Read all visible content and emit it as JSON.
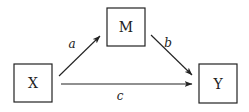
{
  "diagram": {
    "type": "mediation-path-diagram",
    "nodes": [
      {
        "id": "X",
        "label": "X"
      },
      {
        "id": "M",
        "label": "M"
      },
      {
        "id": "Y",
        "label": "Y"
      }
    ],
    "edges": [
      {
        "from": "X",
        "to": "M",
        "label": "a"
      },
      {
        "from": "M",
        "to": "Y",
        "label": "b"
      },
      {
        "from": "X",
        "to": "Y",
        "label": "c"
      }
    ],
    "colors": {
      "stroke": "#222222",
      "background": "#ffffff"
    }
  }
}
